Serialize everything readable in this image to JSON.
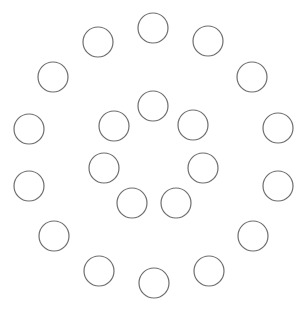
{
  "diagram": {
    "width": 305,
    "height": 311,
    "background": "#ffffff",
    "stroke_color": "#6e6e6e",
    "fill_color": "#ffffff",
    "stroke_width": 1.2,
    "radius": 15,
    "outer_ring": [
      {
        "cx": 153,
        "cy": 28
      },
      {
        "cx": 208,
        "cy": 41
      },
      {
        "cx": 252,
        "cy": 77
      },
      {
        "cx": 278,
        "cy": 128
      },
      {
        "cx": 278,
        "cy": 186
      },
      {
        "cx": 253,
        "cy": 236
      },
      {
        "cx": 209,
        "cy": 271
      },
      {
        "cx": 154,
        "cy": 283
      },
      {
        "cx": 99,
        "cy": 271
      },
      {
        "cx": 54,
        "cy": 236
      },
      {
        "cx": 29,
        "cy": 186
      },
      {
        "cx": 29,
        "cy": 129
      },
      {
        "cx": 53,
        "cy": 77
      },
      {
        "cx": 98,
        "cy": 42
      }
    ],
    "inner_ring": [
      {
        "cx": 153,
        "cy": 106
      },
      {
        "cx": 193,
        "cy": 125
      },
      {
        "cx": 203,
        "cy": 168
      },
      {
        "cx": 176,
        "cy": 203
      },
      {
        "cx": 132,
        "cy": 203
      },
      {
        "cx": 104,
        "cy": 168
      },
      {
        "cx": 114,
        "cy": 126
      }
    ]
  }
}
